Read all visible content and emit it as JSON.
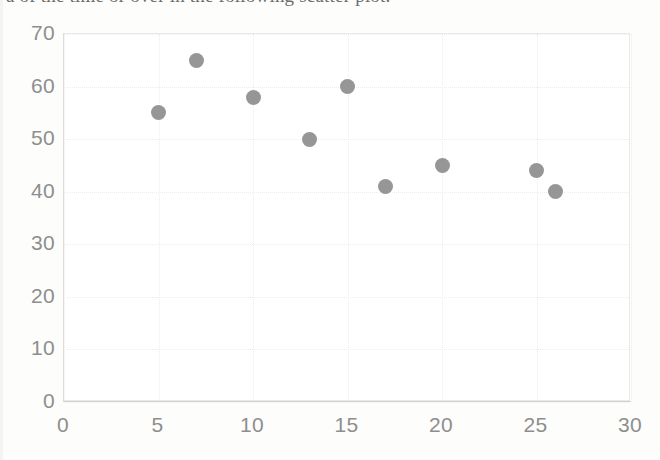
{
  "document": {
    "clipped_text_line": "a of the time or over in the following scatter plot."
  },
  "chart_data": {
    "type": "scatter",
    "title": "",
    "xlabel": "",
    "ylabel": "",
    "xlim": [
      0,
      30
    ],
    "ylim": [
      0,
      70
    ],
    "xticks": [
      0,
      5,
      10,
      15,
      20,
      25,
      30
    ],
    "yticks": [
      0,
      10,
      20,
      30,
      40,
      50,
      60,
      70
    ],
    "grid": true,
    "legend": false,
    "marker_color": "#8d8d8d",
    "marker_shape": "circle",
    "points": [
      {
        "x": 5,
        "y": 55
      },
      {
        "x": 7,
        "y": 65
      },
      {
        "x": 10,
        "y": 58
      },
      {
        "x": 13,
        "y": 50
      },
      {
        "x": 15,
        "y": 60
      },
      {
        "x": 17,
        "y": 41
      },
      {
        "x": 20,
        "y": 45
      },
      {
        "x": 25,
        "y": 44
      },
      {
        "x": 26,
        "y": 40
      }
    ]
  },
  "colors": {
    "marker": "#8d8d8d",
    "gridline": "#ededeb",
    "axis": "#d2d2d0",
    "tick_label": "#8e8e8e",
    "background": "#fdfdfc"
  }
}
